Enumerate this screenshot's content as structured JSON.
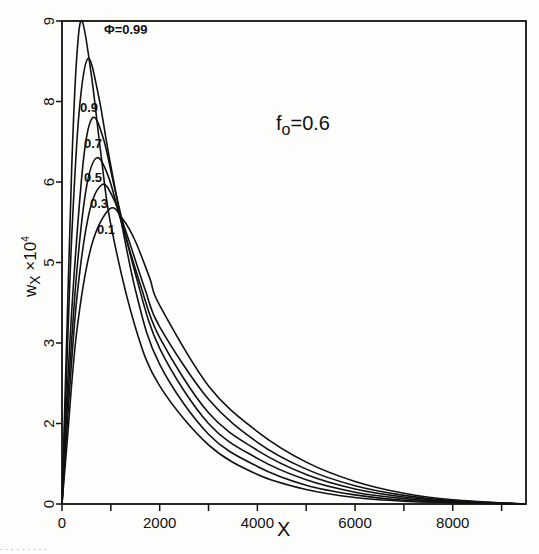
{
  "chart_data": {
    "type": "line",
    "title": "",
    "annotation": "f0=0.6",
    "annotation_main": "f",
    "annotation_sub": "o",
    "annotation_rest": "=0.6",
    "xlabel": "X",
    "ylabel": "w_x ×10^4",
    "ylabel_main": "w",
    "ylabel_sub": "X",
    "ylabel_rest": " ×10",
    "ylabel_sup": "4",
    "xlim": [
      0,
      9500
    ],
    "ylim": [
      0,
      9
    ],
    "x_ticks": [
      0,
      1000,
      2000,
      3000,
      4000,
      5000,
      6000,
      7000,
      8000,
      9000
    ],
    "x_tick_labels": [
      "0",
      "",
      "2000",
      "",
      "4000",
      "",
      "6000",
      "",
      "8000",
      ""
    ],
    "y_ticks": [
      0,
      1.5,
      3,
      4.5,
      6,
      7.5,
      9
    ],
    "y_tick_labels": [
      "0",
      "2",
      "3",
      "5",
      "6",
      "8",
      "9"
    ],
    "grid": false,
    "legend": "inline curve labels",
    "series": [
      {
        "name": "Φ=0.99",
        "label": "Φ=0.99",
        "peak_x": 410,
        "peak_y": 9.0,
        "points": [
          [
            0,
            0
          ],
          [
            100,
            3.2
          ],
          [
            200,
            6.3
          ],
          [
            300,
            8.3
          ],
          [
            410,
            9.0
          ],
          [
            600,
            8.0
          ],
          [
            800,
            6.5
          ],
          [
            1000,
            5.2
          ],
          [
            1500,
            3.3
          ],
          [
            2000,
            2.2
          ],
          [
            3000,
            1.1
          ],
          [
            4000,
            0.55
          ],
          [
            5000,
            0.27
          ],
          [
            6000,
            0.12
          ],
          [
            7000,
            0.05
          ],
          [
            8000,
            0.02
          ],
          [
            9500,
            0.0
          ]
        ]
      },
      {
        "name": "Φ=0.9",
        "label": "0.9",
        "peak_x": 530,
        "peak_y": 8.3,
        "points": [
          [
            0,
            0
          ],
          [
            100,
            2.6
          ],
          [
            200,
            5.0
          ],
          [
            350,
            7.3
          ],
          [
            530,
            8.3
          ],
          [
            750,
            7.6
          ],
          [
            1000,
            6.3
          ],
          [
            1500,
            4.0
          ],
          [
            2000,
            2.6
          ],
          [
            3000,
            1.3
          ],
          [
            4000,
            0.7
          ],
          [
            5000,
            0.35
          ],
          [
            6000,
            0.17
          ],
          [
            7000,
            0.07
          ],
          [
            8000,
            0.03
          ],
          [
            9500,
            0.0
          ]
        ]
      },
      {
        "name": "Φ=0.7",
        "label": "0.7",
        "peak_x": 630,
        "peak_y": 7.2,
        "points": [
          [
            0,
            0
          ],
          [
            100,
            2.0
          ],
          [
            250,
            4.3
          ],
          [
            450,
            6.5
          ],
          [
            630,
            7.2
          ],
          [
            850,
            6.8
          ],
          [
            1100,
            5.8
          ],
          [
            1500,
            4.3
          ],
          [
            2000,
            2.9
          ],
          [
            3000,
            1.5
          ],
          [
            4000,
            0.85
          ],
          [
            5000,
            0.45
          ],
          [
            6000,
            0.22
          ],
          [
            7000,
            0.1
          ],
          [
            8000,
            0.04
          ],
          [
            9500,
            0.0
          ]
        ]
      },
      {
        "name": "Φ=0.5",
        "label": "0.5",
        "peak_x": 710,
        "peak_y": 6.45,
        "points": [
          [
            0,
            0
          ],
          [
            100,
            1.7
          ],
          [
            300,
            4.3
          ],
          [
            500,
            5.9
          ],
          [
            710,
            6.45
          ],
          [
            950,
            6.1
          ],
          [
            1200,
            5.3
          ],
          [
            1600,
            4.1
          ],
          [
            2000,
            3.1
          ],
          [
            3000,
            1.7
          ],
          [
            4000,
            1.0
          ],
          [
            5000,
            0.55
          ],
          [
            6000,
            0.28
          ],
          [
            7000,
            0.13
          ],
          [
            8000,
            0.05
          ],
          [
            9500,
            0.0
          ]
        ]
      },
      {
        "name": "Φ=0.3",
        "label": "0.3",
        "peak_x": 820,
        "peak_y": 5.95,
        "points": [
          [
            0,
            0
          ],
          [
            100,
            1.4
          ],
          [
            300,
            3.8
          ],
          [
            550,
            5.4
          ],
          [
            820,
            5.95
          ],
          [
            1050,
            5.7
          ],
          [
            1300,
            5.1
          ],
          [
            1700,
            4.0
          ],
          [
            2000,
            3.3
          ],
          [
            3000,
            1.95
          ],
          [
            4000,
            1.15
          ],
          [
            5000,
            0.65
          ],
          [
            6000,
            0.34
          ],
          [
            7000,
            0.16
          ],
          [
            8000,
            0.06
          ],
          [
            9500,
            0.0
          ]
        ]
      },
      {
        "name": "Φ=0.1",
        "label": "0.1",
        "peak_x": 980,
        "peak_y": 5.5,
        "points": [
          [
            0,
            0
          ],
          [
            100,
            1.1
          ],
          [
            300,
            3.2
          ],
          [
            600,
            4.8
          ],
          [
            980,
            5.5
          ],
          [
            1250,
            5.3
          ],
          [
            1500,
            4.9
          ],
          [
            1800,
            4.2
          ],
          [
            2000,
            3.7
          ],
          [
            3000,
            2.2
          ],
          [
            4000,
            1.35
          ],
          [
            5000,
            0.78
          ],
          [
            6000,
            0.42
          ],
          [
            7000,
            0.2
          ],
          [
            8000,
            0.08
          ],
          [
            9500,
            0.0
          ]
        ]
      }
    ]
  },
  "footer_fragment": "· · · · · · · · ·"
}
